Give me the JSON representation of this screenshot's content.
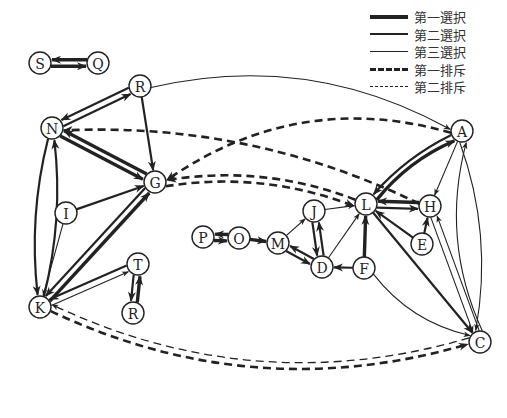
{
  "legend": [
    {
      "label": "第一選択",
      "style": "solid",
      "width": 4
    },
    {
      "label": "第二選択",
      "style": "solid",
      "width": 2.6
    },
    {
      "label": "第三選択",
      "style": "solid",
      "width": 1.3
    },
    {
      "label": "第一排斥",
      "style": "dashed",
      "width": 3
    },
    {
      "label": "第二排斥",
      "style": "dashed",
      "width": 1.5
    }
  ],
  "nodes": [
    {
      "id": "S",
      "x": 40,
      "y": 63
    },
    {
      "id": "Q",
      "x": 98,
      "y": 63
    },
    {
      "id": "R",
      "x": 140,
      "y": 86
    },
    {
      "id": "N",
      "x": 52,
      "y": 128
    },
    {
      "id": "G",
      "x": 155,
      "y": 182
    },
    {
      "id": "I",
      "x": 66,
      "y": 213
    },
    {
      "id": "K",
      "x": 40,
      "y": 307
    },
    {
      "id": "T",
      "x": 138,
      "y": 264
    },
    {
      "id": "R2",
      "label": "R",
      "x": 133,
      "y": 313
    },
    {
      "id": "P",
      "x": 203,
      "y": 237
    },
    {
      "id": "O",
      "x": 239,
      "y": 238
    },
    {
      "id": "M",
      "x": 278,
      "y": 243
    },
    {
      "id": "J",
      "x": 314,
      "y": 211
    },
    {
      "id": "D",
      "x": 322,
      "y": 267
    },
    {
      "id": "F",
      "x": 364,
      "y": 268
    },
    {
      "id": "L",
      "x": 366,
      "y": 204
    },
    {
      "id": "H",
      "x": 430,
      "y": 206
    },
    {
      "id": "E",
      "x": 422,
      "y": 244
    },
    {
      "id": "A",
      "x": 462,
      "y": 131
    },
    {
      "id": "C",
      "x": 480,
      "y": 342
    }
  ],
  "edges": [
    {
      "from": "S",
      "to": "Q",
      "type": "choice1"
    },
    {
      "from": "Q",
      "to": "S",
      "type": "choice1"
    },
    {
      "from": "N",
      "to": "R",
      "type": "choice2"
    },
    {
      "from": "R",
      "to": "N",
      "type": "choice2"
    },
    {
      "from": "R",
      "to": "G",
      "type": "choice2"
    },
    {
      "from": "R",
      "to": "A",
      "type": "choice3"
    },
    {
      "from": "N",
      "to": "G",
      "type": "choice1"
    },
    {
      "from": "G",
      "to": "N",
      "type": "choice1"
    },
    {
      "from": "N",
      "to": "K",
      "type": "choice2"
    },
    {
      "from": "K",
      "to": "N",
      "type": "choice2"
    },
    {
      "from": "I",
      "to": "G",
      "type": "choice2"
    },
    {
      "from": "I",
      "to": "K",
      "type": "choice3"
    },
    {
      "from": "G",
      "to": "K",
      "type": "choice2"
    },
    {
      "from": "K",
      "to": "G",
      "type": "choice1"
    },
    {
      "from": "T",
      "to": "K",
      "type": "choice2"
    },
    {
      "from": "K",
      "to": "T",
      "type": "choice3"
    },
    {
      "from": "T",
      "to": "R2",
      "type": "choice2"
    },
    {
      "from": "R2",
      "to": "T",
      "type": "choice1"
    },
    {
      "from": "P",
      "to": "O",
      "type": "choice1"
    },
    {
      "from": "O",
      "to": "P",
      "type": "choice1"
    },
    {
      "from": "O",
      "to": "M",
      "type": "choice1"
    },
    {
      "from": "M",
      "to": "J",
      "type": "choice3"
    },
    {
      "from": "M",
      "to": "D",
      "type": "choice2"
    },
    {
      "from": "D",
      "to": "M",
      "type": "choice2"
    },
    {
      "from": "J",
      "to": "D",
      "type": "choice2"
    },
    {
      "from": "D",
      "to": "J",
      "type": "choice2"
    },
    {
      "from": "J",
      "to": "L",
      "type": "choice3"
    },
    {
      "from": "D",
      "to": "L",
      "type": "choice3"
    },
    {
      "from": "F",
      "to": "D",
      "type": "choice2"
    },
    {
      "from": "F",
      "to": "L",
      "type": "choice1"
    },
    {
      "from": "F",
      "to": "C",
      "type": "choice3"
    },
    {
      "from": "L",
      "to": "A",
      "type": "choice1"
    },
    {
      "from": "A",
      "to": "L",
      "type": "choice2"
    },
    {
      "from": "L",
      "to": "H",
      "type": "choice2"
    },
    {
      "from": "H",
      "to": "L",
      "type": "choice1"
    },
    {
      "from": "E",
      "to": "L",
      "type": "choice2"
    },
    {
      "from": "E",
      "to": "H",
      "type": "choice2"
    },
    {
      "from": "A",
      "to": "H",
      "type": "choice3"
    },
    {
      "from": "L",
      "to": "C",
      "type": "choice2"
    },
    {
      "from": "H",
      "to": "C",
      "type": "choice3"
    },
    {
      "from": "C",
      "to": "H",
      "type": "choice3"
    },
    {
      "from": "A",
      "to": "C",
      "type": "choice3"
    },
    {
      "from": "C",
      "to": "A",
      "type": "choice3"
    },
    {
      "from": "A",
      "to": "G",
      "type": "reject1"
    },
    {
      "from": "H",
      "to": "N",
      "type": "reject1"
    },
    {
      "from": "G",
      "to": "L",
      "type": "reject1"
    },
    {
      "from": "L",
      "to": "G",
      "type": "reject1"
    },
    {
      "from": "K",
      "to": "C",
      "type": "reject1"
    },
    {
      "from": "C",
      "to": "K",
      "type": "reject2"
    }
  ]
}
